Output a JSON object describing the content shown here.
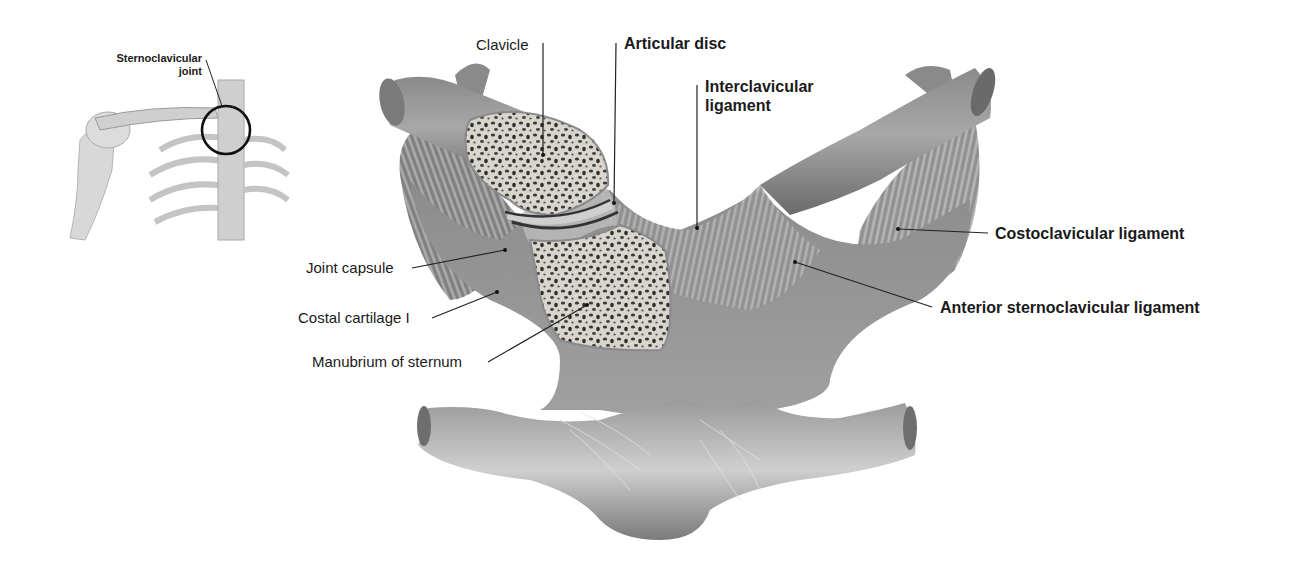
{
  "inset": {
    "label_line1": "Sternoclavicular",
    "label_line2": "joint"
  },
  "labels": {
    "clavicle": "Clavicle",
    "articular_disc": "Articular disc",
    "interclavicular_line1": "Interclavicular",
    "interclavicular_line2": "ligament",
    "joint_capsule": "Joint capsule",
    "costal_cartilage": "Costal cartilage I",
    "manubrium": "Manubrium of sternum",
    "costoclavicular": "Costoclavicular ligament",
    "anterior_sternoclavicular": "Anterior sternoclavicular ligament"
  },
  "colors": {
    "tissue_dark": "#6e6e6e",
    "tissue_mid": "#9a9a9a",
    "tissue_light": "#c8c8c8",
    "bone_cut": "#d8d4cc",
    "leader": "#222222"
  }
}
